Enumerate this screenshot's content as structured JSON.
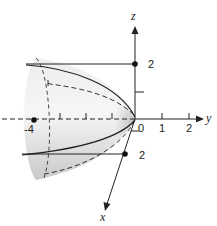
{
  "figure": {
    "type": "3d-surface-diagram",
    "surface": "paraboloid opening in negative y direction, vertex at origin",
    "axes": {
      "x": {
        "label": "x"
      },
      "y": {
        "label": "y"
      },
      "z": {
        "label": "z"
      }
    },
    "tick_labels": {
      "y_0": "0",
      "y_1": "1",
      "y_2": "2",
      "y_neg4": "-4",
      "z_2": "2",
      "x_2": "2"
    },
    "points": [
      {
        "name": "z-axis point",
        "label": "2"
      },
      {
        "name": "x-axis point",
        "label": "2"
      },
      {
        "name": "y-axis point",
        "label": "-4"
      }
    ],
    "colors": {
      "surface_light": "#f4f4f4",
      "surface_shade": "#c8c8c8",
      "line": "#222222"
    }
  }
}
